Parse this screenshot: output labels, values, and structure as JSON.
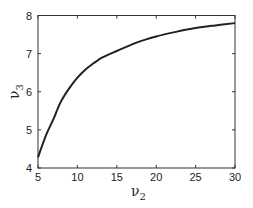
{
  "chart_data": {
    "type": "line",
    "title": "",
    "xlabel": "ν2",
    "ylabel": "ν3",
    "xlabel_parts": {
      "main": "ν",
      "sub": "2"
    },
    "ylabel_parts": {
      "main": "ν",
      "sub": "3"
    },
    "xlim": [
      5,
      30
    ],
    "ylim": [
      4,
      8
    ],
    "xticks": [
      5,
      10,
      15,
      20,
      25,
      30
    ],
    "yticks": [
      4,
      5,
      6,
      7,
      8
    ],
    "grid": false,
    "legend": null,
    "series": [
      {
        "name": "ν3 vs ν2",
        "color": "#222222",
        "x": [
          5,
          6,
          7,
          7.5,
          8,
          9,
          10,
          11,
          12,
          12.5,
          13,
          14,
          15,
          17.5,
          20,
          22.5,
          25,
          27.5,
          30
        ],
        "y": [
          4.28,
          4.85,
          5.3,
          5.56,
          5.78,
          6.1,
          6.37,
          6.58,
          6.74,
          6.81,
          6.88,
          6.98,
          7.07,
          7.29,
          7.45,
          7.57,
          7.67,
          7.74,
          7.8
        ]
      }
    ]
  }
}
